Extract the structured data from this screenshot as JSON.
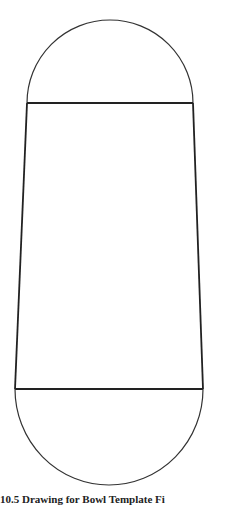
{
  "figure": {
    "caption": "10.5 Drawing for Bowl Template Fi",
    "stroke_color": "#333333",
    "background": "#ffffff"
  },
  "shapes": {
    "top_arc": {
      "cx": 110,
      "cy": 103,
      "r": 83,
      "left_x": 27,
      "right_x": 193
    },
    "trapezoid": {
      "top_y": 103,
      "bottom_y": 389,
      "top_left_x": 27,
      "top_right_x": 193,
      "bottom_left_x": 15,
      "bottom_right_x": 203
    },
    "bottom_arc": {
      "cx": 109,
      "cy": 389,
      "r": 94,
      "left_x": 15,
      "right_x": 203
    }
  }
}
